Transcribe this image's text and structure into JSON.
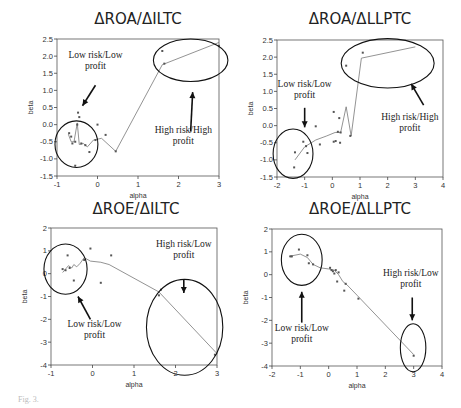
{
  "chart_data": [
    {
      "id": "roa_iltc",
      "type": "scatter",
      "title": "ΔROA/ΔILTC",
      "xlabel": "alpha",
      "ylabel": "beta",
      "xlim": [
        -1,
        3
      ],
      "ylim": [
        -1.5,
        2.5
      ],
      "xticks": [
        -1,
        0,
        1,
        2,
        3
      ],
      "yticks": [
        -1.5,
        -1.0,
        -0.5,
        0.0,
        0.5,
        1.0,
        1.5,
        2.0,
        2.5
      ],
      "ytick_labels": [
        "-1.5",
        "-1.0",
        "-0.5",
        "0.0",
        "0.5",
        "1.0",
        "1.5",
        "2.0",
        "2.5"
      ],
      "grid": false,
      "frame_px": {
        "left": 57,
        "right": 219,
        "top": 39,
        "bottom": 176
      },
      "title_px": {
        "x": 138,
        "y": 14
      },
      "points": [
        [
          -0.48,
          0.35
        ],
        [
          -0.45,
          0.22
        ],
        [
          -0.7,
          -0.25
        ],
        [
          -0.65,
          -0.35
        ],
        [
          -0.55,
          -0.5
        ],
        [
          -0.62,
          -0.55
        ],
        [
          -0.5,
          0.0
        ],
        [
          -0.4,
          -0.55
        ],
        [
          -0.3,
          -0.6
        ],
        [
          -0.2,
          -0.8
        ],
        [
          -0.05,
          -0.45
        ],
        [
          0.0,
          0.0
        ],
        [
          0.2,
          -0.3
        ],
        [
          0.45,
          -0.78
        ],
        [
          1.6,
          2.15
        ],
        [
          1.65,
          1.78
        ],
        [
          3.0,
          2.3
        ],
        [
          -0.55,
          -1.2
        ]
      ],
      "line": [
        [
          -0.72,
          -0.28
        ],
        [
          -0.65,
          -0.5
        ],
        [
          -0.58,
          -0.5
        ],
        [
          -0.5,
          0.05
        ],
        [
          -0.45,
          -0.58
        ],
        [
          -0.35,
          -0.55
        ],
        [
          -0.25,
          -0.65
        ],
        [
          -0.1,
          -0.45
        ],
        [
          0.1,
          -0.4
        ],
        [
          0.45,
          -0.78
        ],
        [
          1.6,
          1.75
        ],
        [
          3.0,
          2.4
        ]
      ],
      "ellipses": [
        {
          "cx": -0.52,
          "cy": -0.57,
          "rx": 0.53,
          "ry": 0.68
        },
        {
          "cx": 2.3,
          "cy": 1.88,
          "rx": 0.92,
          "ry": 0.62
        }
      ],
      "annotations": [
        {
          "lines": [
            "Low risk/Low",
            "profit"
          ],
          "x": -0.05,
          "y": 1.95
        },
        {
          "lines": [
            "High risk/High",
            "profit"
          ],
          "x": 2.12,
          "y": -0.25
        }
      ],
      "arrows": [
        {
          "from": [
            -0.05,
            1.15
          ],
          "to": [
            -0.37,
            0.55
          ]
        },
        {
          "from": [
            2.3,
            -0.2
          ],
          "to": [
            2.35,
            0.95
          ]
        }
      ]
    },
    {
      "id": "roa_llptc",
      "type": "scatter",
      "title": "ΔROA/ΔLLPTC",
      "xlabel": "alpha",
      "ylabel": "beta",
      "xlim": [
        -2,
        4
      ],
      "ylim": [
        -1.5,
        2.5
      ],
      "xticks": [
        -2,
        -1,
        0,
        1,
        2,
        3,
        4
      ],
      "yticks": [
        -1.5,
        -1.0,
        -0.5,
        0.0,
        0.5,
        1.0,
        1.5,
        2.0,
        2.5
      ],
      "ytick_labels": [
        "-1.5",
        "-1.0",
        "-0.5",
        "0.0",
        "0.5",
        "1.0",
        "1.5",
        "2.0",
        "2.5"
      ],
      "grid": false,
      "frame_px": {
        "left": 277,
        "right": 443,
        "top": 40,
        "bottom": 177
      },
      "title_px": {
        "x": 360,
        "y": 14
      },
      "points": [
        [
          -1.38,
          -1.22
        ],
        [
          -1.35,
          -0.78
        ],
        [
          -1.05,
          -0.47
        ],
        [
          -0.95,
          -0.6
        ],
        [
          -0.9,
          -0.8
        ],
        [
          -0.6,
          -0.02
        ],
        [
          -0.45,
          -0.55
        ],
        [
          0.05,
          0.4
        ],
        [
          0.05,
          -0.47
        ],
        [
          0.12,
          -0.45
        ],
        [
          0.25,
          0.22
        ],
        [
          0.28,
          -0.5
        ],
        [
          0.5,
          1.75
        ],
        [
          0.65,
          -0.3
        ],
        [
          1.1,
          2.13
        ],
        [
          0.2,
          -0.18
        ],
        [
          0.3,
          -0.2
        ]
      ],
      "line": [
        [
          -1.35,
          -1.0
        ],
        [
          -1.0,
          -0.62
        ],
        [
          -0.6,
          -0.42
        ],
        [
          -0.2,
          -0.3
        ],
        [
          0.1,
          -0.2
        ],
        [
          0.3,
          -0.2
        ],
        [
          0.5,
          0.55
        ],
        [
          0.68,
          -0.3
        ],
        [
          1.05,
          1.97
        ],
        [
          3.0,
          2.3
        ]
      ],
      "ellipses": [
        {
          "cx": -1.42,
          "cy": -0.82,
          "rx": 0.72,
          "ry": 0.72
        },
        {
          "cx": 2.0,
          "cy": 1.82,
          "rx": 1.68,
          "ry": 0.72
        }
      ],
      "annotations": [
        {
          "lines": [
            "Low risk/Low",
            "profit"
          ],
          "x": -1.0,
          "y": 1.12
        },
        {
          "lines": [
            "High risk/High",
            "profit"
          ],
          "x": 2.8,
          "y": 0.15
        }
      ],
      "arrows": [
        {
          "from": [
            -1.0,
            0.52
          ],
          "to": [
            -1.0,
            -0.05
          ]
        },
        {
          "from": [
            3.3,
            0.6
          ],
          "to": [
            2.85,
            1.22
          ]
        }
      ]
    },
    {
      "id": "roe_iltc",
      "type": "scatter",
      "title": "ΔROE/ΔILTC",
      "xlabel": "alpha",
      "ylabel": "beta",
      "xlim": [
        -1,
        3
      ],
      "ylim": [
        -4,
        2
      ],
      "xticks": [
        -1,
        0,
        1,
        2,
        3
      ],
      "yticks": [
        -4,
        -3,
        -2,
        -1,
        0,
        1,
        2
      ],
      "ytick_labels": [
        "-4",
        "-3",
        "-2",
        "-1",
        "0",
        "1",
        "2"
      ],
      "grid": false,
      "frame_px": {
        "left": 51,
        "right": 217,
        "top": 228,
        "bottom": 365
      },
      "title_px": {
        "x": 136,
        "y": 204
      },
      "points": [
        [
          -0.05,
          1.1
        ],
        [
          0.45,
          0.8
        ],
        [
          -0.6,
          0.8
        ],
        [
          -0.72,
          0.2
        ],
        [
          -0.65,
          0.15
        ],
        [
          -0.55,
          0.25
        ],
        [
          -0.45,
          -0.3
        ],
        [
          -0.2,
          0.6
        ],
        [
          0.2,
          -0.4
        ],
        [
          1.6,
          -0.95
        ],
        [
          1.65,
          -0.7
        ],
        [
          2.95,
          -3.55
        ]
      ],
      "line": [
        [
          -0.72,
          0.05
        ],
        [
          -0.65,
          0.2
        ],
        [
          -0.58,
          0.35
        ],
        [
          -0.5,
          0.25
        ],
        [
          -0.45,
          0.4
        ],
        [
          -0.38,
          0.3
        ],
        [
          -0.3,
          0.45
        ],
        [
          -0.2,
          0.7
        ],
        [
          -0.05,
          0.55
        ],
        [
          0.2,
          0.5
        ],
        [
          0.4,
          0.4
        ],
        [
          1.6,
          -0.8
        ],
        [
          3.0,
          -3.5
        ]
      ],
      "ellipses": [
        {
          "cx": -0.65,
          "cy": 0.2,
          "rx": 0.52,
          "ry": 1.1
        },
        {
          "cx": 2.22,
          "cy": -2.35,
          "rx": 0.92,
          "ry": 2.1
        }
      ],
      "annotations": [
        {
          "lines": [
            "High risk/Low",
            "profit"
          ],
          "x": 2.2,
          "y": 1.15
        },
        {
          "lines": [
            "Low risk/Low",
            "profit"
          ],
          "x": 0.05,
          "y": -2.35
        }
      ],
      "arrows": [
        {
          "from": [
            2.2,
            -0.25
          ],
          "to": [
            2.2,
            -0.85
          ]
        },
        {
          "from": [
            -0.05,
            -2.0
          ],
          "to": [
            -0.35,
            -1.0
          ]
        }
      ]
    },
    {
      "id": "roe_llptc",
      "type": "scatter",
      "title": "ΔROE/ΔLLPTC",
      "xlabel": "alpha",
      "ylabel": "beta",
      "xlim": [
        -2,
        4
      ],
      "ylim": [
        -4,
        2
      ],
      "xticks": [
        -2,
        -1,
        0,
        1,
        2,
        3,
        4
      ],
      "yticks": [
        -4,
        -3,
        -2,
        -1,
        0,
        1,
        2
      ],
      "ytick_labels": [
        "-4",
        "-3",
        "-2",
        "-1",
        "0",
        "1",
        "2"
      ],
      "grid": false,
      "frame_px": {
        "left": 272,
        "right": 442,
        "top": 229,
        "bottom": 366
      },
      "title_px": {
        "x": 360,
        "y": 204
      },
      "points": [
        [
          -1.35,
          0.8
        ],
        [
          -1.05,
          1.1
        ],
        [
          -0.75,
          0.85
        ],
        [
          -0.7,
          0.5
        ],
        [
          -0.55,
          0.45
        ],
        [
          0.05,
          0.3
        ],
        [
          0.1,
          0.2
        ],
        [
          0.15,
          0.15
        ],
        [
          0.2,
          0.05
        ],
        [
          0.25,
          0.2
        ],
        [
          0.3,
          -0.3
        ],
        [
          0.35,
          0.1
        ],
        [
          0.55,
          -0.7
        ],
        [
          0.6,
          -0.4
        ],
        [
          1.05,
          -1.05
        ],
        [
          3.0,
          -3.55
        ],
        [
          -1.3,
          0.8
        ]
      ],
      "line": [
        [
          -1.4,
          0.8
        ],
        [
          -1.0,
          0.9
        ],
        [
          -0.75,
          0.75
        ],
        [
          -0.55,
          0.45
        ],
        [
          -0.3,
          0.3
        ],
        [
          0.0,
          0.25
        ],
        [
          0.2,
          0.2
        ],
        [
          0.35,
          0.0
        ],
        [
          0.5,
          -0.3
        ],
        [
          0.65,
          -0.45
        ],
        [
          1.0,
          -0.9
        ],
        [
          3.0,
          -3.5
        ]
      ],
      "ellipses": [
        {
          "cx": -0.95,
          "cy": 0.65,
          "rx": 0.72,
          "ry": 1.12
        },
        {
          "cx": 2.98,
          "cy": -3.2,
          "rx": 0.45,
          "ry": 1.05
        }
      ],
      "annotations": [
        {
          "lines": [
            "High risk/Low",
            "profit"
          ],
          "x": 2.9,
          "y": -0.05
        },
        {
          "lines": [
            "Low risk/Low",
            "profit"
          ],
          "x": -0.95,
          "y": -2.45
        }
      ],
      "arrows": [
        {
          "from": [
            2.95,
            -1.0
          ],
          "to": [
            2.95,
            -2.0
          ]
        },
        {
          "from": [
            -0.95,
            -2.1
          ],
          "to": [
            -0.95,
            -0.75
          ]
        }
      ]
    }
  ],
  "caption": "Fig. 3."
}
